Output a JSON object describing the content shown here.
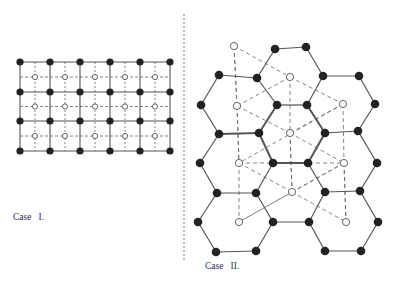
{
  "figure": {
    "colors": {
      "ink": "#222222",
      "line": "#555555",
      "dash": "#666666"
    },
    "case1": {
      "label": "Case   I.",
      "label_pos": [
        13,
        212
      ],
      "xs": [
        20,
        50,
        80,
        110,
        140,
        170
      ],
      "ys": [
        62,
        92,
        121,
        151
      ],
      "description": "Square lattice: 6x4 filled nodes, 5x3 open centre sites, dashed lines through centres"
    },
    "case2": {
      "label": "Case   II.",
      "label_pos": [
        205,
        261
      ],
      "divider": {
        "x": 184,
        "y1": 14,
        "y2": 262
      },
      "hex_vertices": [
        [
          275,
          49
        ],
        [
          306,
          47
        ],
        [
          219,
          75
        ],
        [
          257,
          78
        ],
        [
          323,
          76
        ],
        [
          359,
          76
        ],
        [
          201,
          105
        ],
        [
          277,
          105
        ],
        [
          307,
          105
        ],
        [
          375,
          104
        ],
        [
          219,
          134
        ],
        [
          259,
          133
        ],
        [
          325,
          133
        ],
        [
          358,
          131
        ],
        [
          200,
          163
        ],
        [
          273,
          163
        ],
        [
          308,
          163
        ],
        [
          377,
          163
        ],
        [
          217,
          193
        ],
        [
          256,
          193
        ],
        [
          325,
          192
        ],
        [
          360,
          191
        ],
        [
          198,
          222
        ],
        [
          273,
          222
        ],
        [
          309,
          222
        ],
        [
          378,
          222
        ],
        [
          216,
          252
        ],
        [
          256,
          251
        ],
        [
          325,
          251
        ],
        [
          361,
          251
        ]
      ],
      "hex_edges": [
        [
          0,
          1
        ],
        [
          0,
          3
        ],
        [
          1,
          4
        ],
        [
          2,
          3
        ],
        [
          4,
          5
        ],
        [
          2,
          6
        ],
        [
          3,
          7
        ],
        [
          4,
          8
        ],
        [
          5,
          9
        ],
        [
          6,
          10
        ],
        [
          7,
          11
        ],
        [
          7,
          8
        ],
        [
          8,
          12
        ],
        [
          9,
          13
        ],
        [
          10,
          11
        ],
        [
          12,
          13
        ],
        [
          10,
          14
        ],
        [
          11,
          15
        ],
        [
          12,
          16
        ],
        [
          13,
          17
        ],
        [
          15,
          16
        ],
        [
          14,
          18
        ],
        [
          15,
          19
        ],
        [
          16,
          20
        ],
        [
          17,
          21
        ],
        [
          18,
          19
        ],
        [
          20,
          21
        ],
        [
          18,
          22
        ],
        [
          19,
          23
        ],
        [
          20,
          24
        ],
        [
          21,
          25
        ],
        [
          23,
          24
        ],
        [
          22,
          26
        ],
        [
          23,
          27
        ],
        [
          24,
          28
        ],
        [
          25,
          29
        ],
        [
          26,
          27
        ],
        [
          28,
          29
        ]
      ],
      "thick_edges": [
        [
          7,
          11
        ],
        [
          8,
          12
        ],
        [
          10,
          11
        ],
        [
          15,
          16
        ],
        [
          11,
          15
        ],
        [
          12,
          16
        ]
      ],
      "open_sites": [
        [
          234,
          46
        ],
        [
          290,
          77
        ],
        [
          237,
          106
        ],
        [
          343,
          104
        ],
        [
          290,
          133
        ],
        [
          239,
          163
        ],
        [
          344,
          163
        ],
        [
          292,
          192
        ],
        [
          239,
          222
        ],
        [
          346,
          222
        ]
      ],
      "dashed_links": [
        [
          0,
          1
        ],
        [
          1,
          3
        ],
        [
          1,
          2
        ],
        [
          0,
          2
        ],
        [
          2,
          4
        ],
        [
          2,
          5
        ],
        [
          3,
          4
        ],
        [
          3,
          5
        ],
        [
          4,
          6
        ],
        [
          4,
          7
        ],
        [
          5,
          6
        ],
        [
          5,
          7
        ],
        [
          6,
          8
        ],
        [
          7,
          8
        ],
        [
          6,
          9
        ],
        [
          7,
          9
        ],
        [
          6,
          7
        ]
      ],
      "vertical_dashes": [
        [
          0,
          2
        ],
        [
          2,
          5
        ],
        [
          5,
          8
        ],
        [
          1,
          4
        ],
        [
          4,
          7
        ],
        [
          3,
          6
        ],
        [
          6,
          9
        ]
      ]
    }
  }
}
